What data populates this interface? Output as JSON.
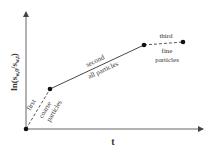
{
  "diagram": {
    "type": "piecewise-linear-drying-stages",
    "y_axis": {
      "label_prefix": "ln(s",
      "label_sub1": "w,0",
      "label_mid": "/s",
      "label_sub2": "w,t",
      "label_suffix": ")"
    },
    "x_axis": {
      "label": "t"
    },
    "points": [
      {
        "name": "origin",
        "x": 26,
        "y": 129
      },
      {
        "name": "p1",
        "x": 50,
        "y": 89
      },
      {
        "name": "p2",
        "x": 144,
        "y": 45
      },
      {
        "name": "p3",
        "x": 183,
        "y": 42
      }
    ],
    "segments": [
      {
        "stage": "first",
        "description": "coarse particles",
        "style": "dashed",
        "line1": "first",
        "line2": "coarse",
        "line3": "particles"
      },
      {
        "stage": "second",
        "description": "all particles",
        "style": "solid",
        "line1": "second",
        "line2": "all particles"
      },
      {
        "stage": "third",
        "description": "fine particles",
        "style": "dashed",
        "line1": "third",
        "line2": "fine",
        "line3": "particles"
      }
    ],
    "colors": {
      "axis": "#555555",
      "line": "#333333",
      "point": "#111111",
      "text": "#333333"
    }
  }
}
